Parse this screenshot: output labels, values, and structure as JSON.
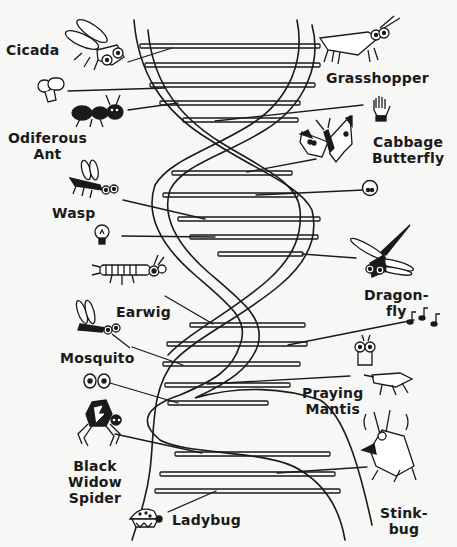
{
  "diagram": {
    "type": "dna-double-helix-cartoon",
    "background": "#f7f7f5",
    "ink_color": "#1a1a1a",
    "labels": {
      "cicada": "Cicada",
      "grasshopper": "Grasshopper",
      "odiferous_1": "Odiferous",
      "odiferous_2": "Ant",
      "cabbage_1": "Cabbage",
      "cabbage_2": "Butterfly",
      "wasp": "Wasp",
      "dragonfly_1": "Dragon-",
      "dragonfly_2": "fly",
      "earwig": "Earwig",
      "mosquito": "Mosquito",
      "mantis_1": "Praying",
      "mantis_2": "Mantis",
      "spider_1": "Black",
      "spider_2": "Widow",
      "spider_3": "Spider",
      "stinkbug_1": "Stink-",
      "stinkbug_2": "bug",
      "ladybug": "Ladybug"
    },
    "icons": [
      {
        "name": "cicada-icon",
        "trait": "insect"
      },
      {
        "name": "grasshopper-icon",
        "trait": "insect"
      },
      {
        "name": "tooth-icon",
        "trait": "molar"
      },
      {
        "name": "glove-hand-icon",
        "trait": "hand"
      },
      {
        "name": "ant-icon",
        "trait": "insect"
      },
      {
        "name": "butterfly-icon",
        "trait": "insect"
      },
      {
        "name": "face-eyes-icon",
        "trait": "face"
      },
      {
        "name": "wasp-icon",
        "trait": "insect"
      },
      {
        "name": "light-bulb-icon",
        "trait": "idea"
      },
      {
        "name": "dragonfly-icon",
        "trait": "insect"
      },
      {
        "name": "earwig-icon",
        "trait": "insect"
      },
      {
        "name": "music-notes-icon",
        "trait": "sound"
      },
      {
        "name": "mosquito-icon",
        "trait": "insect"
      },
      {
        "name": "eyes-icon",
        "trait": "eyes"
      },
      {
        "name": "praying-mantis-icon",
        "trait": "insect"
      },
      {
        "name": "spider-icon",
        "trait": "insect"
      },
      {
        "name": "stinkbug-icon",
        "trait": "insect"
      },
      {
        "name": "ladybug-icon",
        "trait": "insect"
      }
    ]
  }
}
